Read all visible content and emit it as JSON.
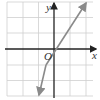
{
  "diagram": {
    "type": "coordinate-plane-line",
    "axes": {
      "x_label": "x",
      "y_label": "y",
      "origin_label": "O"
    },
    "grid": {
      "x_range": [
        -3,
        2
      ],
      "y_range": [
        -3,
        3
      ],
      "cell_px": 15.7
    },
    "line": {
      "equation": "y = 2x - 1",
      "slope": 2,
      "y_intercept": -1,
      "x_intercept": 0.5,
      "color": "#8a8a8a",
      "arrows": "both"
    },
    "colors": {
      "grid": "#cfcfcf",
      "axis": "#222222",
      "line": "#8a8a8a"
    }
  }
}
